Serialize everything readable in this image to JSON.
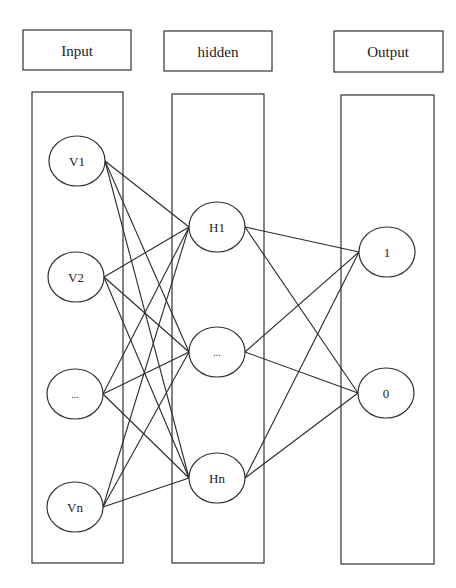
{
  "diagram": {
    "type": "neural-network",
    "layers": [
      {
        "id": "input",
        "header": "Input",
        "nodes": [
          {
            "label": "V1",
            "cx": 77,
            "cy": 161
          },
          {
            "label": "V2",
            "cx": 76,
            "cy": 277
          },
          {
            "label": "...",
            "cx": 75,
            "cy": 394
          },
          {
            "label": "Vn",
            "cx": 75,
            "cy": 507
          }
        ]
      },
      {
        "id": "hidden",
        "header": "hidden",
        "nodes": [
          {
            "label": "H1",
            "cx": 217,
            "cy": 227
          },
          {
            "label": "...",
            "cx": 217,
            "cy": 352
          },
          {
            "label": "Hn",
            "cx": 217,
            "cy": 478
          }
        ]
      },
      {
        "id": "output",
        "header": "Output",
        "nodes": [
          {
            "label": "1",
            "cx": 387,
            "cy": 252
          },
          {
            "label": "0",
            "cx": 386,
            "cy": 393
          }
        ]
      }
    ],
    "connections": "fully-connected between adjacent layers",
    "colors": {
      "stroke": "#333333",
      "background": "#ffffff",
      "text": "#222222"
    }
  }
}
